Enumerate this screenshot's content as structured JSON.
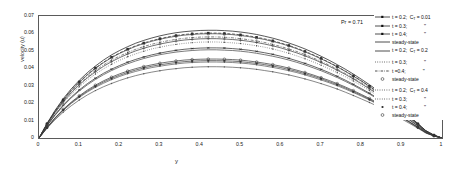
{
  "chart_data": {
    "type": "line",
    "title": "",
    "xlabel": "y",
    "ylabel": "velocity (u)",
    "xlim": [
      0,
      1
    ],
    "ylim": [
      0,
      0.07
    ],
    "xticks": [
      "0",
      "0.1",
      "0.2",
      "0.3",
      "0.4",
      "0.5",
      "0.6",
      "0.7",
      "0.8",
      "0.9",
      "1"
    ],
    "yticks": [
      "0",
      "0.01",
      "0.02",
      "0.03",
      "0.04",
      "0.05",
      "0.06",
      "0.07"
    ],
    "grid": false,
    "legend_position": "right-outside",
    "annotations": [
      {
        "text": "Pr = 0.71",
        "x": 0.8,
        "y": 0.066
      }
    ],
    "x": [
      0,
      0.02,
      0.04,
      0.06,
      0.08,
      0.1,
      0.12,
      0.14,
      0.16,
      0.18,
      0.2,
      0.22,
      0.24,
      0.26,
      0.28,
      0.3,
      0.32,
      0.34,
      0.36,
      0.38,
      0.4,
      0.42,
      0.44,
      0.46,
      0.48,
      0.5,
      0.52,
      0.54,
      0.56,
      0.58,
      0.6,
      0.62,
      0.64,
      0.66,
      0.68,
      0.7,
      0.72,
      0.74,
      0.76,
      0.78,
      0.8,
      0.82,
      0.84,
      0.86,
      0.88,
      0.9,
      0.92,
      0.94,
      0.96,
      0.98,
      1
    ],
    "series": [
      {
        "name": "t = 0.2; C_T = 0.01",
        "label": "t = 0.2;",
        "param": "C_T = 0.01",
        "marker": "asterisk",
        "linestyle": "solid",
        "color": "#222222",
        "values": [
          0,
          0.0072,
          0.0134,
          0.0188,
          0.0235,
          0.0276,
          0.0312,
          0.0343,
          0.0371,
          0.0395,
          0.0416,
          0.0435,
          0.0451,
          0.0465,
          0.0477,
          0.0487,
          0.0496,
          0.0503,
          0.0509,
          0.0513,
          0.0516,
          0.0517,
          0.0517,
          0.0516,
          0.0513,
          0.0509,
          0.0504,
          0.0497,
          0.0489,
          0.048,
          0.0469,
          0.0457,
          0.0443,
          0.0428,
          0.0412,
          0.0394,
          0.0375,
          0.0354,
          0.0332,
          0.0308,
          0.0283,
          0.0257,
          0.0229,
          0.02,
          0.0169,
          0.0137,
          0.0104,
          0.007,
          0.0035,
          0.0013,
          0
        ]
      },
      {
        "name": "t = 0.3; C_T = 0.01",
        "label": "t = 0.3;",
        "param": "\"",
        "marker": "plus",
        "linestyle": "solid",
        "color": "#333333",
        "values": [
          0,
          0.0078,
          0.0147,
          0.0207,
          0.0259,
          0.0305,
          0.0345,
          0.038,
          0.0411,
          0.0438,
          0.0461,
          0.0482,
          0.05,
          0.0515,
          0.0528,
          0.0539,
          0.0548,
          0.0556,
          0.0562,
          0.0566,
          0.0569,
          0.057,
          0.057,
          0.0568,
          0.0565,
          0.0561,
          0.0555,
          0.0548,
          0.0539,
          0.0529,
          0.0517,
          0.0503,
          0.0488,
          0.0471,
          0.0453,
          0.0433,
          0.0412,
          0.0389,
          0.0365,
          0.0339,
          0.0311,
          0.0282,
          0.0252,
          0.022,
          0.0186,
          0.0151,
          0.0114,
          0.0077,
          0.0039,
          0.0015,
          0
        ]
      },
      {
        "name": "t = 0.4; C_T = 0.01",
        "label": "t = 0.4;",
        "param": "\"",
        "marker": "square-filled",
        "linestyle": "dashed",
        "color": "#2a2a2a",
        "values": [
          0,
          0.0082,
          0.0155,
          0.0219,
          0.0274,
          0.0322,
          0.0365,
          0.0402,
          0.0435,
          0.0464,
          0.0488,
          0.051,
          0.0529,
          0.0545,
          0.0559,
          0.057,
          0.058,
          0.0588,
          0.0594,
          0.0598,
          0.0601,
          0.0602,
          0.0602,
          0.06,
          0.0597,
          0.0592,
          0.0586,
          0.0578,
          0.0569,
          0.0558,
          0.0545,
          0.0531,
          0.0515,
          0.0497,
          0.0478,
          0.0457,
          0.0434,
          0.041,
          0.0384,
          0.0357,
          0.0328,
          0.0297,
          0.0265,
          0.0231,
          0.0196,
          0.0159,
          0.012,
          0.0081,
          0.0041,
          0.0016,
          0
        ]
      },
      {
        "name": "steady-state; C_T = 0.01",
        "label": "steady-state",
        "param": "",
        "marker": "none",
        "linestyle": "solid",
        "color": "#111111",
        "values": [
          0,
          0.0084,
          0.0159,
          0.0225,
          0.0282,
          0.0331,
          0.0375,
          0.0413,
          0.0447,
          0.0477,
          0.0502,
          0.0524,
          0.0544,
          0.056,
          0.0574,
          0.0586,
          0.0596,
          0.0604,
          0.061,
          0.0614,
          0.0617,
          0.0618,
          0.0618,
          0.0616,
          0.0613,
          0.0608,
          0.0602,
          0.0594,
          0.0584,
          0.0573,
          0.056,
          0.0545,
          0.0529,
          0.0511,
          0.0491,
          0.0469,
          0.0446,
          0.0421,
          0.0395,
          0.0367,
          0.0337,
          0.0306,
          0.0273,
          0.0238,
          0.0202,
          0.0164,
          0.0124,
          0.0083,
          0.0042,
          0.0017,
          0
        ]
      },
      {
        "name": "t = 0.2; C_T = 0.2",
        "label": "t = 0.2;",
        "param": "C_T = 0.2",
        "marker": "none",
        "linestyle": "solid",
        "color": "#444444",
        "values": [
          0,
          0.007,
          0.0131,
          0.0184,
          0.023,
          0.027,
          0.0305,
          0.0336,
          0.0363,
          0.0387,
          0.0408,
          0.0426,
          0.0442,
          0.0456,
          0.0468,
          0.0478,
          0.0486,
          0.0493,
          0.0498,
          0.0502,
          0.0505,
          0.0506,
          0.0506,
          0.0504,
          0.0502,
          0.0498,
          0.0493,
          0.0486,
          0.0478,
          0.0469,
          0.0459,
          0.0447,
          0.0434,
          0.0419,
          0.0403,
          0.0386,
          0.0367,
          0.0347,
          0.0325,
          0.0302,
          0.0277,
          0.0252,
          0.0225,
          0.0196,
          0.0166,
          0.0134,
          0.0102,
          0.0069,
          0.0035,
          0.0013,
          0
        ]
      },
      {
        "name": "t = 0.3; C_T = 0.2",
        "label": "t = 0.3;",
        "param": "\"",
        "marker": "dot",
        "linestyle": "dotted",
        "color": "#4a4a4a",
        "values": [
          0,
          0.0075,
          0.0142,
          0.02,
          0.025,
          0.0294,
          0.0333,
          0.0367,
          0.0397,
          0.0423,
          0.0446,
          0.0466,
          0.0483,
          0.0498,
          0.0511,
          0.0521,
          0.053,
          0.0537,
          0.0543,
          0.0547,
          0.055,
          0.0551,
          0.0551,
          0.0549,
          0.0546,
          0.0542,
          0.0536,
          0.0529,
          0.0521,
          0.0511,
          0.0499,
          0.0486,
          0.0471,
          0.0455,
          0.0437,
          0.0418,
          0.0397,
          0.0375,
          0.0352,
          0.0327,
          0.03,
          0.0272,
          0.0243,
          0.0212,
          0.018,
          0.0146,
          0.011,
          0.0074,
          0.0038,
          0.0014,
          0
        ]
      },
      {
        "name": "t = 0.4; C_T = 0.2",
        "label": "t =0.4;",
        "param": "\"",
        "marker": "dot",
        "linestyle": "dashdot",
        "color": "#4a4a4a",
        "values": [
          0,
          0.0079,
          0.0149,
          0.0211,
          0.0264,
          0.031,
          0.0351,
          0.0387,
          0.0419,
          0.0447,
          0.047,
          0.0491,
          0.0509,
          0.0525,
          0.0538,
          0.0549,
          0.0558,
          0.0566,
          0.0572,
          0.0576,
          0.0579,
          0.058,
          0.058,
          0.0578,
          0.0575,
          0.057,
          0.0564,
          0.0557,
          0.0548,
          0.0537,
          0.0525,
          0.0511,
          0.0496,
          0.0479,
          0.046,
          0.044,
          0.0418,
          0.0395,
          0.037,
          0.0344,
          0.0316,
          0.0287,
          0.0256,
          0.0223,
          0.0189,
          0.0154,
          0.0116,
          0.0078,
          0.004,
          0.0015,
          0
        ]
      },
      {
        "name": "steady-state; C_T = 0.2",
        "label": "steady-state",
        "param": "",
        "marker": "circle",
        "linestyle": "solid",
        "color": "#3a3a3a",
        "values": [
          0,
          0.0081,
          0.0153,
          0.0217,
          0.0272,
          0.0319,
          0.0362,
          0.0399,
          0.0432,
          0.0461,
          0.0485,
          0.0507,
          0.0526,
          0.0542,
          0.0555,
          0.0567,
          0.0576,
          0.0584,
          0.059,
          0.0594,
          0.0597,
          0.0598,
          0.0598,
          0.0596,
          0.0593,
          0.0588,
          0.0582,
          0.0574,
          0.0565,
          0.0554,
          0.0542,
          0.0528,
          0.0512,
          0.0494,
          0.0475,
          0.0454,
          0.0432,
          0.0408,
          0.0382,
          0.0355,
          0.0326,
          0.0296,
          0.0264,
          0.023,
          0.0195,
          0.0159,
          0.012,
          0.0081,
          0.0041,
          0.0016,
          0
        ]
      },
      {
        "name": "t = 0.2; C_T = 0.4",
        "label": "t = 0.2;",
        "param": "C_T = 0.4",
        "marker": "dot",
        "linestyle": "solid",
        "color": "#555555",
        "values": [
          0,
          0.0056,
          0.0105,
          0.0148,
          0.0185,
          0.0218,
          0.0247,
          0.0272,
          0.0294,
          0.0313,
          0.033,
          0.0345,
          0.0358,
          0.0369,
          0.0378,
          0.0386,
          0.0393,
          0.0398,
          0.0403,
          0.0406,
          0.0408,
          0.0409,
          0.0409,
          0.0408,
          0.0406,
          0.0403,
          0.0399,
          0.0394,
          0.0387,
          0.038,
          0.0371,
          0.0362,
          0.0351,
          0.0339,
          0.0326,
          0.0312,
          0.0297,
          0.0281,
          0.0263,
          0.0244,
          0.0224,
          0.0204,
          0.0182,
          0.0159,
          0.0134,
          0.0109,
          0.0083,
          0.0056,
          0.0028,
          0.0011,
          0
        ]
      },
      {
        "name": "t = 0.3; C_T = 0.4",
        "label": "t = 0.3;",
        "param": "\"",
        "marker": "dot",
        "linestyle": "solid",
        "color": "#555555",
        "values": [
          0,
          0.0059,
          0.0112,
          0.0158,
          0.0198,
          0.0233,
          0.0264,
          0.0291,
          0.0314,
          0.0335,
          0.0353,
          0.0369,
          0.0382,
          0.0394,
          0.0404,
          0.0412,
          0.0419,
          0.0425,
          0.043,
          0.0433,
          0.0435,
          0.0436,
          0.0436,
          0.0435,
          0.0433,
          0.043,
          0.0426,
          0.042,
          0.0413,
          0.0405,
          0.0396,
          0.0386,
          0.0375,
          0.0362,
          0.0348,
          0.0333,
          0.0317,
          0.03,
          0.0281,
          0.0261,
          0.024,
          0.0218,
          0.0194,
          0.017,
          0.0144,
          0.0117,
          0.0089,
          0.006,
          0.003,
          0.0012,
          0
        ]
      },
      {
        "name": "t = 0.4; C_T = 0.4",
        "label": "t = 0.4;",
        "param": "\"",
        "marker": "square-small",
        "linestyle": "solid",
        "color": "#3a3a3a",
        "values": [
          0,
          0.006,
          0.0114,
          0.0161,
          0.0202,
          0.0238,
          0.0269,
          0.0297,
          0.0321,
          0.0342,
          0.036,
          0.0376,
          0.039,
          0.0402,
          0.0412,
          0.042,
          0.0427,
          0.0433,
          0.0438,
          0.0441,
          0.0443,
          0.0444,
          0.0444,
          0.0443,
          0.0441,
          0.0438,
          0.0433,
          0.0428,
          0.0421,
          0.0413,
          0.0404,
          0.0393,
          0.0382,
          0.0369,
          0.0355,
          0.034,
          0.0323,
          0.0306,
          0.0287,
          0.0266,
          0.0245,
          0.0222,
          0.0198,
          0.0173,
          0.0147,
          0.0119,
          0.009,
          0.0061,
          0.0031,
          0.0012,
          0
        ]
      },
      {
        "name": "steady-state; C_T = 0.4",
        "label": "steady-state",
        "param": "",
        "marker": "circle",
        "linestyle": "solid",
        "color": "#333333",
        "values": [
          0,
          0.0061,
          0.0116,
          0.0164,
          0.0206,
          0.0242,
          0.0275,
          0.0303,
          0.0328,
          0.0349,
          0.0368,
          0.0384,
          0.0398,
          0.041,
          0.042,
          0.0429,
          0.0436,
          0.0442,
          0.0447,
          0.045,
          0.0452,
          0.0453,
          0.0453,
          0.0452,
          0.045,
          0.0447,
          0.0442,
          0.0436,
          0.0429,
          0.0421,
          0.0412,
          0.0401,
          0.0389,
          0.0376,
          0.0362,
          0.0346,
          0.033,
          0.0312,
          0.0293,
          0.0272,
          0.025,
          0.0227,
          0.0202,
          0.0177,
          0.015,
          0.0122,
          0.0093,
          0.0062,
          0.0031,
          0.0012,
          0
        ]
      }
    ]
  },
  "legend": {
    "rows": [
      {
        "label": "t = 0.2;",
        "param": "C",
        "sub": "T",
        "param_tail": " = 0.01",
        "sym": "asterisk-line"
      },
      {
        "label": "t = 0.3;",
        "param_tail": "\"",
        "sym": "plus-line"
      },
      {
        "label": "t = 0.4;",
        "param_tail": "\"",
        "sym": "square-line"
      },
      {
        "label": "steady-state",
        "param_tail": "",
        "sym": "solid-line"
      },
      {
        "label": "t = 0.2;",
        "param": "C",
        "sub": "T",
        "param_tail": " = 0.2",
        "sym": "solid-line"
      },
      {
        "label": "t = 0.3;",
        "param_tail": "\"",
        "sym": "dot"
      },
      {
        "label": "t =0.4;",
        "param_tail": "\"",
        "sym": "dashdot"
      },
      {
        "label": "steady-state",
        "param_tail": "",
        "sym": "circle"
      },
      {
        "label": "t = 0.2;",
        "param": "C",
        "sub": "T",
        "param_tail": " = 0.4",
        "sym": "dot"
      },
      {
        "label": "t = 0.3;",
        "param_tail": "\"",
        "sym": "dot"
      },
      {
        "label": "t = 0.4;",
        "param_tail": "\"",
        "sym": "square-small"
      },
      {
        "label": "steady-state",
        "param_tail": "",
        "sym": "circle"
      }
    ]
  },
  "axes": {
    "ylabel": "velocity (u)",
    "xlabel": "y",
    "yticks": [
      "0.07",
      "0.06",
      "0.05",
      "0.04",
      "0.03",
      "0.02",
      "0.01",
      "0"
    ],
    "xticks": [
      "0",
      "0.1",
      "0.2",
      "0.3",
      "0.4",
      "0.5",
      "0.6",
      "0.7",
      "0.8",
      "0.9",
      "1"
    ]
  },
  "annotation": {
    "pr": "Pr = 0.71"
  }
}
